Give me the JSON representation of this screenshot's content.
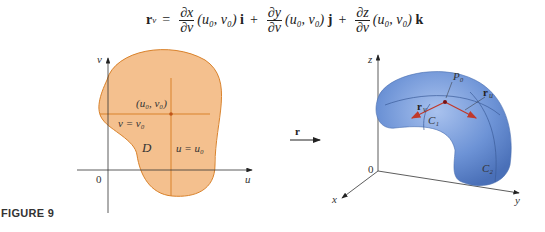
{
  "equation": {
    "lhs": "r",
    "lhs_sub": "v",
    "equals": "=",
    "terms": [
      {
        "num": "∂x",
        "den": "∂v",
        "args": "(u₀, v₀)",
        "unit": "i"
      },
      {
        "num": "∂y",
        "den": "∂v",
        "args": "(u₀, v₀)",
        "unit": "j"
      },
      {
        "num": "∂z",
        "den": "∂v",
        "args": "(u₀, v₀)",
        "unit": "k"
      }
    ],
    "plus": "+"
  },
  "caption": "FIGURE 9",
  "left_diagram": {
    "axis_u": "u",
    "axis_v": "v",
    "origin": "0",
    "region": "D",
    "point": "(u₀, v₀)",
    "line_h": "v = v₀",
    "line_v": "u = u₀",
    "region_color": "#f4c08e",
    "line_color": "#d9822b"
  },
  "mapping": {
    "label": "r"
  },
  "right_diagram": {
    "axis_x": "x",
    "axis_y": "y",
    "axis_z": "z",
    "origin": "0",
    "point": "P₀",
    "vector_v": "r",
    "vector_v_sub": "v",
    "vector_u": "r",
    "vector_u_sub": "u",
    "curve1": "C₁",
    "curve2": "C₂",
    "surface_color": "#6d93d6",
    "vector_color": "#c0392b"
  }
}
